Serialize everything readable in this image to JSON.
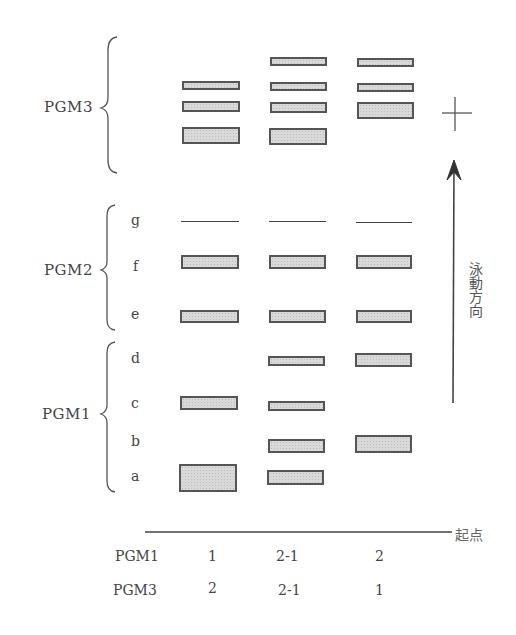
{
  "diagram": {
    "type": "electrophoresis_zymogram",
    "groups": [
      {
        "label": "PGM3",
        "rows": []
      },
      {
        "label": "PGM2",
        "rows": [
          "g",
          "f",
          "e"
        ]
      },
      {
        "label": "PGM1",
        "rows": [
          "d",
          "c",
          "b",
          "a"
        ]
      }
    ],
    "anode_symbol": "+",
    "direction_label": "泳動方向",
    "origin_label": "起点",
    "phenotype_table": {
      "rows": [
        {
          "label": "PGM1",
          "values": [
            "1",
            "2-1",
            "2"
          ]
        },
        {
          "label": "PGM3",
          "values": [
            "2",
            "2-1",
            "1"
          ]
        }
      ]
    },
    "lanes": [
      {
        "index": 1,
        "pgm1": "1",
        "pgm3": "2",
        "bands": {
          "PGM3": [
            "upper",
            "middle",
            "lower-thick"
          ],
          "g": "line",
          "f": "band",
          "e": "band",
          "c": "band",
          "a": "thick"
        }
      },
      {
        "index": 2,
        "pgm1": "2-1",
        "pgm3": "2-1",
        "bands": {
          "PGM3": [
            "top",
            "upper",
            "middle",
            "lower-thick"
          ],
          "g": "line",
          "f": "band",
          "e": "band",
          "d": "band",
          "c": "band",
          "b": "band",
          "a": "band"
        }
      },
      {
        "index": 3,
        "pgm1": "2",
        "pgm3": "1",
        "bands": {
          "PGM3": [
            "top",
            "upper",
            "middle-thick"
          ],
          "g": "line",
          "f": "band",
          "e": "band",
          "d": "band",
          "b": "thick"
        }
      }
    ]
  }
}
